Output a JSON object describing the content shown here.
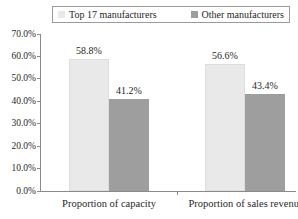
{
  "chart_data": {
    "type": "bar",
    "title": "",
    "xlabel": "",
    "ylabel": "",
    "categories": [
      "Proportion of capacity",
      "Proportion of sales revenue"
    ],
    "series": [
      {
        "name": "Top 17 manufacturers",
        "values": [
          58.8,
          56.6
        ],
        "labels": [
          "58.8%",
          "56.6%"
        ],
        "color": "#e9e9e9"
      },
      {
        "name": "Other manufacturers",
        "values": [
          41.2,
          43.4
        ],
        "labels": [
          "41.2%",
          "43.4%"
        ],
        "color": "#9e9e9e"
      }
    ],
    "ylim": [
      0,
      70
    ],
    "ytick_step": 10,
    "ytick_labels": [
      "0.0%",
      "10.0%",
      "20.0%",
      "30.0%",
      "40.0%",
      "50.0%",
      "60.0%",
      "70.0%"
    ],
    "legend_position": "top",
    "grid": false
  },
  "colors": {
    "axis": "#8a8a8a",
    "text": "#1f1f1f",
    "legend_border": "#9a9a9a",
    "background": "#ffffff"
  }
}
